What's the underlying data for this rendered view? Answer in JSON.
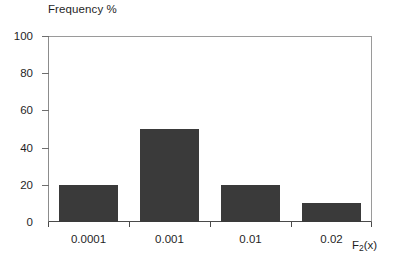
{
  "chart_data": {
    "type": "bar",
    "title": "Frequency %",
    "xlabel": "F2(x)",
    "ylabel": "Frequency %",
    "categories": [
      "0.0001",
      "0.001",
      "0.01",
      "0.02"
    ],
    "values": [
      20,
      50,
      20,
      10
    ],
    "ylim": [
      0,
      100
    ],
    "yticks": [
      0,
      20,
      40,
      60,
      80,
      100
    ],
    "ytick_labels": [
      "0",
      "20",
      "40",
      "60",
      "80",
      "100"
    ],
    "grid": false,
    "legend": null,
    "bar_color": "#3a3a3a",
    "frame_color": "#9a9a9a",
    "axis_color": "#4a4a4a"
  },
  "axis_caption": {
    "base": "F",
    "subscript": "2",
    "suffix": "(x)"
  }
}
